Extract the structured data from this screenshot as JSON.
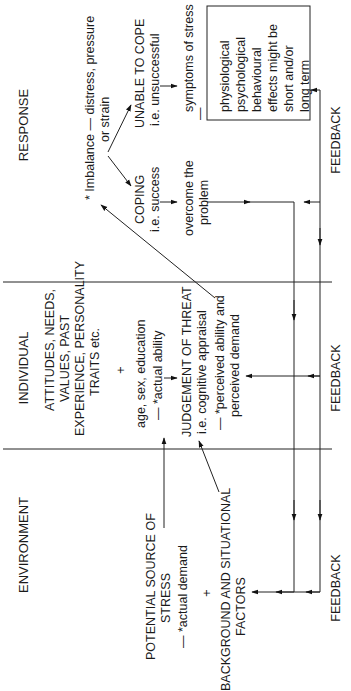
{
  "columns": {
    "response": "RESPONSE",
    "individual": "INDIVIDUAL",
    "environment": "ENVIRONMENT"
  },
  "response": {
    "imbalance": [
      "* Imbalance — distress, pressure",
      "or strain"
    ],
    "unable": [
      "UNABLE TO COPE",
      "i.e. unsuccessful"
    ],
    "coping": [
      "COPING",
      "i.e. success"
    ],
    "symptoms": "symptoms of stress",
    "dash": "—",
    "overcome": [
      "overcome the",
      "problem"
    ],
    "effects_box": [
      "physiological",
      "psychological",
      "behavioural",
      "effects might be",
      "short and/or",
      "long term"
    ]
  },
  "individual": {
    "attitudes": [
      "ATTITUDES, NEEDS,",
      "VALUES,  PAST",
      "EXPERIENCE, PERSONALITY",
      "TRAITS etc."
    ],
    "plus": "+",
    "demographics": "age, sex, education",
    "actual_ability": "— *actual ability",
    "judgement": [
      "JUDGEMENT OF THREAT",
      "i.e. cognitive appraisal"
    ],
    "perceived": [
      "— *perceived ability and",
      "perceived demand"
    ]
  },
  "environment": {
    "source": [
      "POTENTIAL SOURCE OF",
      "STRESS"
    ],
    "actual_demand": "— *actual demand",
    "plus": "+",
    "background": [
      "BACKGROUND AND SITUATIONAL",
      "FACTORS"
    ]
  },
  "feedback_label": "FEEDBACK"
}
